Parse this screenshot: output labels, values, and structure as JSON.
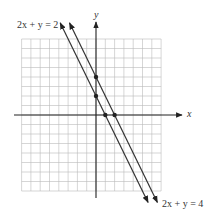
{
  "chart_data": {
    "type": "line",
    "title": "",
    "xlabel": "x",
    "ylabel": "y",
    "xlim": [
      -8,
      7
    ],
    "ylim": [
      -8,
      8
    ],
    "grid": true,
    "series": [
      {
        "name": "2x + y = 2",
        "equation": "2x + y = 2",
        "slope": -2,
        "intercept": 2,
        "marked_points": [
          [
            0,
            2
          ],
          [
            1,
            0
          ]
        ]
      },
      {
        "name": "2x + y = 4",
        "equation": "2x + y = 4",
        "slope": -2,
        "intercept": 4,
        "marked_points": [
          [
            0,
            4
          ],
          [
            2,
            0
          ]
        ]
      }
    ],
    "annotations": [
      {
        "text": "2x + y = 2",
        "position": "top-left"
      },
      {
        "text": "2x + y = 4",
        "position": "bottom-right"
      }
    ]
  },
  "labels": {
    "line1": "2x + y = 2",
    "line2": "2x + y = 4",
    "x_axis": "x",
    "y_axis": "y"
  }
}
